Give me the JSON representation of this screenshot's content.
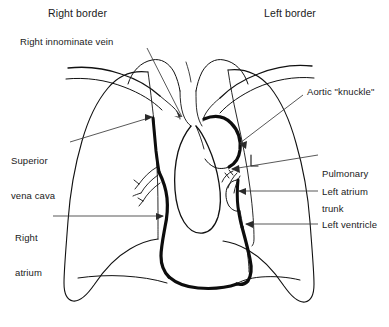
{
  "figure": {
    "background_color": "#ffffff",
    "line_color": "#111111",
    "leader_color": "#3a3a3a",
    "width": 389,
    "height": 327
  },
  "headings": {
    "right_border": "Right border",
    "left_border": "Left border"
  },
  "labels": {
    "right_innominate_vein": "Right innominate vein",
    "aortic_knuckle": "Aortic \"knuckle\"",
    "superior_vena_cava_line1": "Superior",
    "superior_vena_cava_line2": "vena cava",
    "pulmonary_trunk_line1": "Pulmonary",
    "pulmonary_trunk_line2": "trunk",
    "left_atrium": "Left atrium",
    "right_atrium_line1": "Right",
    "right_atrium_line2": "atrium",
    "left_ventricle": "Left ventricle"
  },
  "annotations": [
    {
      "name": "right-border-heading",
      "text": "Right border",
      "side": "left"
    },
    {
      "name": "left-border-heading",
      "text": "Left border",
      "side": "right"
    },
    {
      "name": "right-innominate-vein",
      "text": "Right innominate vein",
      "side": "left"
    },
    {
      "name": "superior-vena-cava",
      "text": "Superior vena cava",
      "side": "left"
    },
    {
      "name": "right-atrium",
      "text": "Right atrium",
      "side": "left"
    },
    {
      "name": "aortic-knuckle",
      "text": "Aortic \"knuckle\"",
      "side": "right"
    },
    {
      "name": "pulmonary-trunk",
      "text": "Pulmonary trunk",
      "side": "right"
    },
    {
      "name": "left-atrium",
      "text": "Left atrium",
      "side": "right"
    },
    {
      "name": "left-ventricle",
      "text": "Left ventricle",
      "side": "right"
    }
  ]
}
